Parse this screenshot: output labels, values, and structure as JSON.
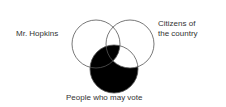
{
  "diagram": {
    "type": "venn",
    "sets": [
      {
        "id": "left",
        "label": "Mr. Hopkins",
        "cx": 96,
        "cy": 44,
        "r": 24
      },
      {
        "id": "right",
        "label_lines": [
          "Citizens of",
          "the country"
        ],
        "cx": 130,
        "cy": 44,
        "r": 24
      },
      {
        "id": "bottom",
        "label": "People who may vote",
        "cx": 114,
        "cy": 69,
        "r": 24
      }
    ],
    "shaded_region": "bottom minus (right not in left)",
    "colors": {
      "stroke": "#555555",
      "fill": "#000000",
      "background": "#ffffff"
    }
  },
  "labels": {
    "left": "Mr. Hopkins",
    "right_line1": "Citizens of",
    "right_line2": "the country",
    "bottom": "People who may vote"
  }
}
